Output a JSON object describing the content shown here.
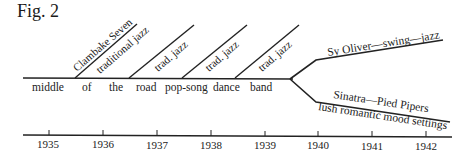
{
  "figure": {
    "title": "Fig.  2"
  },
  "main_line_labels": [
    "middle",
    "of",
    "the",
    "road",
    "pop-song",
    "dance",
    "band"
  ],
  "branches": [
    {
      "upper": "Clambake Seven",
      "lower": "traditional jazz"
    },
    {
      "lower": "trad. jazz"
    },
    {
      "lower": "trad. jazz"
    },
    {
      "lower": "trad. jazz"
    },
    {
      "lower": "trad. jazz"
    }
  ],
  "fork": {
    "upper_label": "Sy Oliver—swing—jazz",
    "lower_label_top": "Sinatra—Pied Pipers",
    "lower_label_bottom": "lush romantic mood settings"
  },
  "timeline": {
    "years": [
      "1935",
      "1936",
      "1937",
      "1938",
      "1939",
      "1940",
      "1941",
      "1942"
    ]
  }
}
